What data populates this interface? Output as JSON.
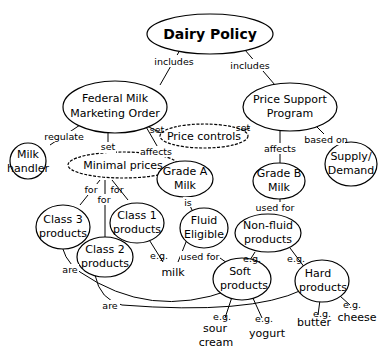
{
  "diagram": {
    "title": "Dairy Policy",
    "nodes": {
      "dairy_policy": "Dairy Policy",
      "fmmo_1": "Federal Milk",
      "fmmo_2": "Marketing Order",
      "psp_1": "Price Support",
      "psp_2": "Program",
      "milk_handler_1": "Milk",
      "milk_handler_2": "handler",
      "minimal_prices": "Minimal prices",
      "price_controls": "Price controls",
      "supply_demand_1": "Supply/",
      "supply_demand_2": "Demand",
      "grade_a_1": "Grade A",
      "grade_a_2": "Milk",
      "grade_b_1": "Grade B",
      "grade_b_2": "Milk",
      "class3_1": "Class 3",
      "class3_2": "products",
      "class1_1": "Class 1",
      "class1_2": "products",
      "class2_1": "Class 2",
      "class2_2": "products",
      "fluid_1": "Fluid",
      "fluid_2": "Eligible",
      "nonfluid_1": "Non-fluid",
      "nonfluid_2": "products",
      "milk": "milk",
      "soft_1": "Soft",
      "soft_2": "products",
      "hard_1": "Hard",
      "hard_2": "products",
      "sour_cream_1": "sour",
      "sour_cream_2": "cream",
      "yogurt": "yogurt",
      "butter": "butter",
      "cheese": "cheese"
    },
    "links": {
      "includes_left": "includes",
      "includes_right": "includes",
      "regulate": "regulate",
      "set_minimal": "set",
      "set_fmmo_pc": "set",
      "set_psp_pc": "set",
      "affects_grade_a": "affects",
      "affects_grade_b": "affects",
      "based_on": "based on",
      "for_class3": "for",
      "for_class2": "for",
      "for_class1": "for",
      "is": "is",
      "used_for_fluid": "used for",
      "used_for_nonfluid": "used for",
      "eg_class1_milk": "e.g.",
      "eg_nonfluid_soft": "e.g.",
      "eg_nonfluid_hard": "e.g.",
      "eg_sour_cream": "e.g.",
      "eg_yogurt": "e.g.",
      "eg_butter": "e.g.",
      "eg_cheese": "e.g.",
      "are_class3": "are",
      "are_class2": "are"
    }
  }
}
